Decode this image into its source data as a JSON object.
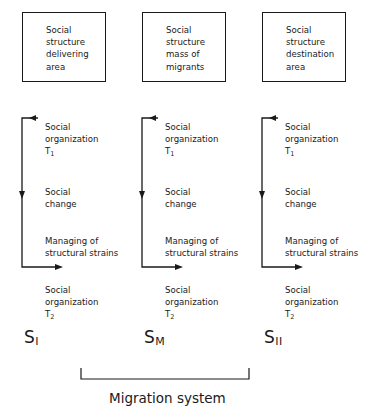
{
  "diagram": {
    "columns": [
      {
        "id": "delivering",
        "box_lines": [
          "Social",
          "structure",
          "delivering",
          "area"
        ],
        "org_t1": {
          "line1": "Social",
          "line2": "organization",
          "t": "T",
          "sub": "1"
        },
        "change": {
          "line1": "Social",
          "line2": "change"
        },
        "strains": {
          "line1": "Managing of",
          "line2": "structural strains"
        },
        "org_t2": {
          "line1": "Social",
          "line2": "organization",
          "t": "T",
          "sub": "2"
        },
        "system_label": {
          "s": "S",
          "sub": "I"
        }
      },
      {
        "id": "migrants",
        "box_lines": [
          "Social",
          "structure",
          "mass of",
          "migrants"
        ],
        "org_t1": {
          "line1": "Social",
          "line2": "organization",
          "t": "T",
          "sub": "1"
        },
        "change": {
          "line1": "Social",
          "line2": "change"
        },
        "strains": {
          "line1": "Managing of",
          "line2": "structural strains"
        },
        "org_t2": {
          "line1": "Social",
          "line2": "organization",
          "t": "T",
          "sub": "2"
        },
        "system_label": {
          "s": "S",
          "sub": "M"
        }
      },
      {
        "id": "destination",
        "box_lines": [
          "Social",
          "structure",
          "destination",
          "area"
        ],
        "org_t1": {
          "line1": "Social",
          "line2": "organization",
          "t": "T",
          "sub": "1"
        },
        "change": {
          "line1": "Social",
          "line2": "change"
        },
        "strains": {
          "line1": "Managing of",
          "line2": "structural strains"
        },
        "org_t2": {
          "line1": "Social",
          "line2": "organization",
          "t": "T",
          "sub": "2"
        },
        "system_label": {
          "s": "S",
          "sub": "II"
        }
      }
    ],
    "bracket_caption": "Migration system",
    "line_color": "#1a1a1a"
  }
}
